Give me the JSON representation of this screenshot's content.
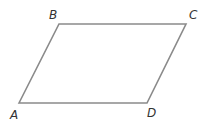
{
  "diagram": {
    "shape": "parallelogram",
    "stroke_color": "#8a8a8a",
    "label_color": "#333333",
    "vertices": {
      "A": {
        "label": "A",
        "x": 19,
        "y": 103,
        "label_x": 10,
        "label_y": 119
      },
      "B": {
        "label": "B",
        "x": 59,
        "y": 24,
        "label_x": 49,
        "label_y": 19
      },
      "C": {
        "label": "C",
        "x": 186,
        "y": 24,
        "label_x": 189,
        "label_y": 19
      },
      "D": {
        "label": "D",
        "x": 147,
        "y": 103,
        "label_x": 147,
        "label_y": 117
      }
    },
    "edges": [
      "AB",
      "BC",
      "CD",
      "DA"
    ]
  }
}
